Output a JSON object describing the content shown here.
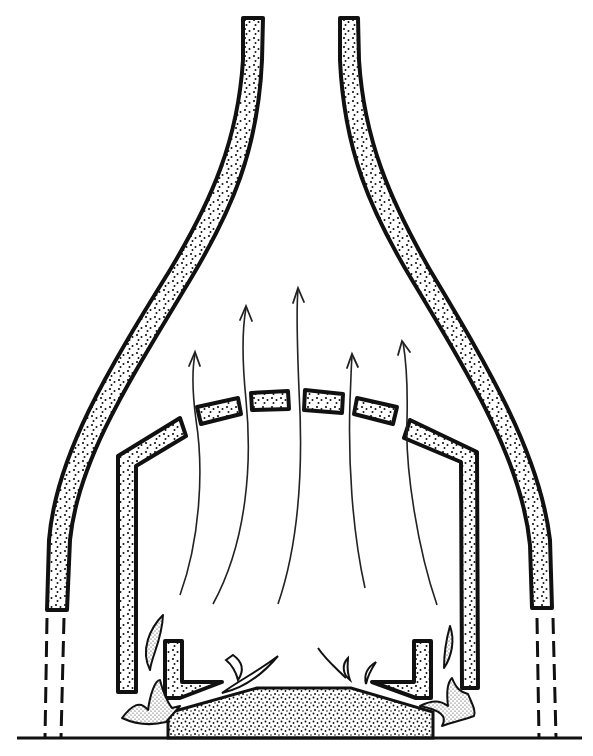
{
  "diagram": {
    "title": "",
    "colors": {
      "ink": "#111111",
      "background": "#ffffff"
    },
    "components": {
      "outer_hood_left": "left-chimney-wall",
      "outer_hood_right": "right-chimney-wall",
      "hidden_supports": "dashed-support-lines",
      "inner_arch": "perforated-inner-arch",
      "arch_bricks_count": 4,
      "firedogs": "l-shaped-firedogs",
      "fuel_bed": "stippled-fuel-bed",
      "flow_arrows_count": 5,
      "ground": "floor-line"
    },
    "labels": []
  }
}
